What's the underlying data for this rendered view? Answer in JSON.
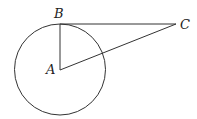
{
  "diagram": {
    "type": "geometry",
    "points": {
      "A": {
        "label": "A",
        "x": 60,
        "y": 70
      },
      "B": {
        "label": "B",
        "x": 60,
        "y": 24
      },
      "C": {
        "label": "C",
        "x": 176,
        "y": 24
      }
    },
    "circle": {
      "center": "A",
      "radius": 45.5
    },
    "segments": [
      "AB",
      "BC",
      "AC"
    ],
    "colors": {
      "stroke": "#333333",
      "background": "#ffffff"
    }
  }
}
